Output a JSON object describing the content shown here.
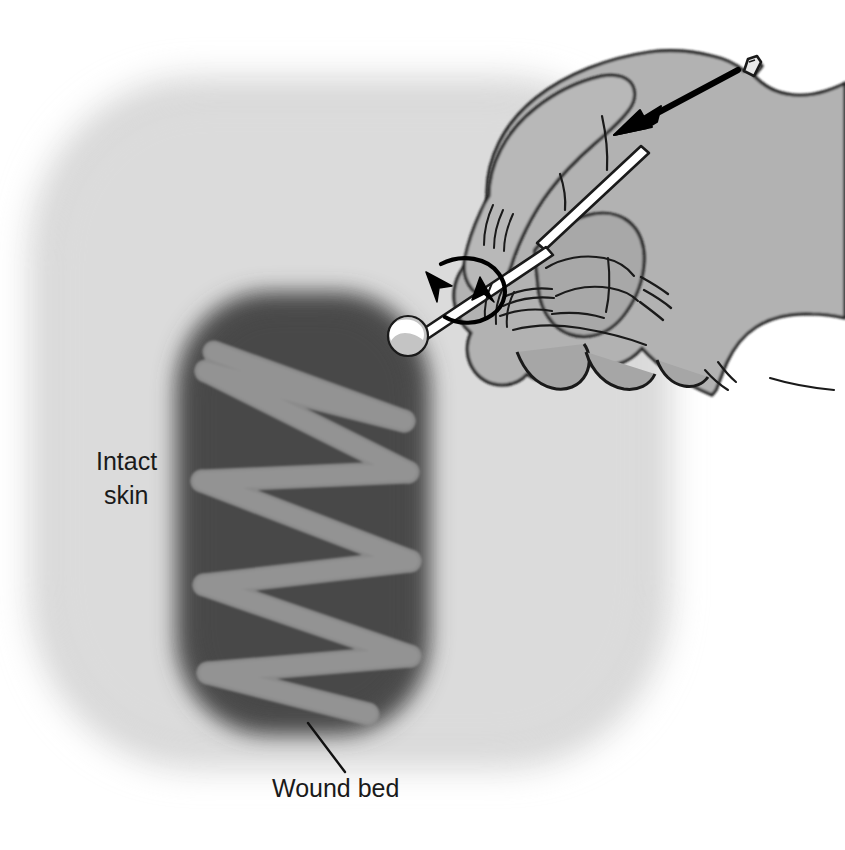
{
  "figure": {
    "type": "medical-procedure-line-drawing",
    "background_color": "#ffffff"
  },
  "labels": [
    {
      "id": "intact-skin",
      "line1": "Intact",
      "line2": "skin",
      "x": 96,
      "y": 470,
      "has_leader_line": false,
      "color": "#1a1a1a"
    },
    {
      "id": "wound-bed",
      "text": "Wound bed",
      "x": 272,
      "y": 797,
      "has_leader_line": true,
      "color": "#1a1a1a"
    }
  ],
  "anatomy": {
    "intact_skin": {
      "name": "Intact skin",
      "fill": "#d9d9d9",
      "shape": "rounded-rectangle-blurred",
      "x": 30,
      "y": 75,
      "width": 650,
      "height": 700
    },
    "wound_bed": {
      "name": "Wound bed",
      "fill": "#4f4f4f",
      "shape": "rounded-rectangle-blurred",
      "x": 178,
      "y": 290,
      "width": 250,
      "height": 445
    }
  },
  "swab_stroke": {
    "name": "Z-pattern swab stroke path",
    "color": "#8c8c8c",
    "stroke_width": 22,
    "pattern": "zigzag-ten-stroke",
    "points": [
      [
        212,
        353
      ],
      [
        400,
        420
      ],
      [
        207,
        372
      ],
      [
        405,
        470
      ],
      [
        203,
        480
      ],
      [
        408,
        560
      ],
      [
        205,
        583
      ],
      [
        408,
        655
      ],
      [
        210,
        672
      ],
      [
        366,
        712
      ]
    ]
  },
  "swab": {
    "name": "cotton-tipped applicator",
    "tip": {
      "cx": 408,
      "cy": 336,
      "r": 19,
      "fill": "#c9c9c9",
      "highlight_fill": "#ffffff"
    },
    "shaft": {
      "fill": "#ffffff",
      "outline": "#1a1a1a",
      "from": [
        420,
        330
      ],
      "to": [
        648,
        148
      ],
      "width": 9
    }
  },
  "hand": {
    "name": "gloved clinician hand",
    "fill": "#b0b0b0",
    "outline": "#1a1a1a",
    "glove_cuff_tab": true,
    "motion_lines": 6
  },
  "arrows": [
    {
      "id": "pressure-arrow",
      "name": "downward pressure arrow",
      "direction": "down-left",
      "from": [
        735,
        72
      ],
      "to": [
        625,
        130
      ],
      "color": "#000000"
    },
    {
      "id": "rotation-arrow",
      "name": "rotation arrow around swab shaft",
      "direction": "rotate",
      "center": [
        465,
        300
      ],
      "color": "#000000"
    }
  ],
  "colors": {
    "skin": "#d9d9d9",
    "wound": "#4f4f4f",
    "stroke_path": "#8c8c8c",
    "glove": "#b0b0b0",
    "outline": "#1a1a1a",
    "background": "#ffffff",
    "swab_white": "#ffffff"
  }
}
